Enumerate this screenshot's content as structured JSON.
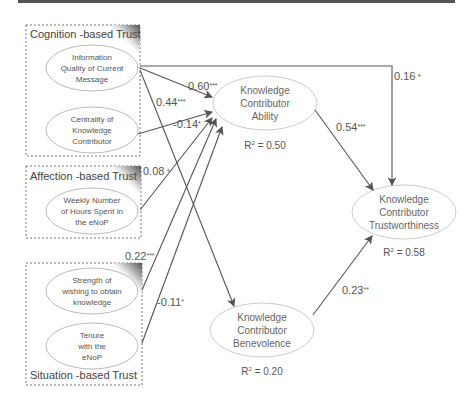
{
  "groups": [
    {
      "id": "cognition",
      "title": "Cognition -based Trust"
    },
    {
      "id": "affection",
      "title": "Affection -based Trust"
    },
    {
      "id": "situation",
      "title": "Situation -based Trust"
    }
  ],
  "antecedents": [
    {
      "id": "info_quality",
      "lines": [
        "Information",
        "Quality of Current",
        "Message"
      ]
    },
    {
      "id": "centrality",
      "lines": [
        "Centrality of",
        "Knowledge",
        "Contributor"
      ]
    },
    {
      "id": "weekly_hours",
      "lines": [
        "Weekly Number",
        "of Hours Spent in",
        "the eNoP"
      ]
    },
    {
      "id": "strength",
      "lines": [
        "Strength of",
        "wishing to obtain",
        "knowledge"
      ]
    },
    {
      "id": "tenure",
      "lines": [
        "Tenure",
        "with the",
        "eNoP"
      ]
    }
  ],
  "constructs": [
    {
      "id": "ability",
      "lines": [
        "Knowledge",
        "Contributor",
        "Ability"
      ],
      "r2_label": "R",
      "r2_sup": "2",
      "r2_value": " = 0.50"
    },
    {
      "id": "benevolence",
      "lines": [
        "Knowledge",
        "Contributor",
        "Benevolence"
      ],
      "r2_label": "R",
      "r2_sup": "2",
      "r2_value": " = 0.20"
    },
    {
      "id": "trustworthiness",
      "lines": [
        "Knowledge",
        "Contributor",
        "Trustworthiness"
      ],
      "r2_label": "R",
      "r2_sup": "2",
      "r2_value": " = 0.58"
    }
  ],
  "paths": [
    {
      "from": "info_quality",
      "to": "ability",
      "coef": "0.60",
      "sig": "***"
    },
    {
      "from": "info_quality",
      "to": "benevolence",
      "coef": "0.44",
      "sig": "***"
    },
    {
      "from": "info_quality",
      "to": "trustworthiness",
      "coef": "0.16",
      "sig": " +"
    },
    {
      "from": "centrality",
      "to": "ability",
      "coef": "-0.14",
      "sig": "*"
    },
    {
      "from": "weekly_hours",
      "to": "ability",
      "coef": "0.08",
      "sig": " +"
    },
    {
      "from": "strength",
      "to": "ability",
      "coef": "0.22",
      "sig": "***"
    },
    {
      "from": "tenure",
      "to": "ability",
      "coef": "-0.11",
      "sig": "*"
    },
    {
      "from": "ability",
      "to": "trustworthiness",
      "coef": "0.54",
      "sig": "***"
    },
    {
      "from": "benevolence",
      "to": "trustworthiness",
      "coef": "0.23",
      "sig": "**"
    }
  ]
}
